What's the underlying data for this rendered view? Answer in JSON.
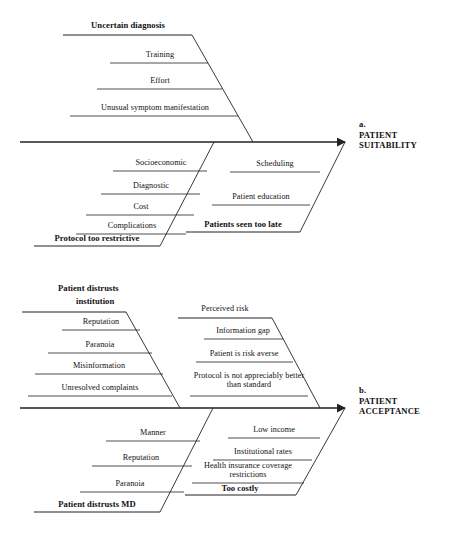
{
  "figure": {
    "type": "fishbone-ishikawa-diagram",
    "background_color": "#ffffff",
    "line_color": "#222222"
  },
  "diagrams": [
    {
      "id": "a",
      "marker": "a.",
      "effect_line1": "PATIENT",
      "effect_line2": "SUITABILITY",
      "categories": [
        {
          "name": "uncertain-diagnosis",
          "label": "Uncertain diagnosis",
          "position": "top-left",
          "causes": [
            "Training",
            "Effort",
            "Unusual symptom manifestation"
          ]
        },
        {
          "name": "protocol-too-restrictive",
          "label": "Protocol too restrictive",
          "position": "bottom-left",
          "causes": [
            "Socioeconomic",
            "Diagnostic",
            "Cost",
            "Complications"
          ]
        },
        {
          "name": "patients-seen-too-late",
          "label": "Patients seen too late",
          "position": "bottom-right",
          "causes": [
            "Scheduling",
            "Patient education"
          ]
        }
      ]
    },
    {
      "id": "b",
      "marker": "b.",
      "effect_line1": "PATIENT",
      "effect_line2": "ACCEPTANCE",
      "categories": [
        {
          "name": "patient-distrusts-institution",
          "label_line1": "Patient distrusts",
          "label_line2": "institution",
          "position": "top-left",
          "causes": [
            "Reputation",
            "Paranoia",
            "Misinformation",
            "Unresolved complaints"
          ]
        },
        {
          "name": "perceived-risk",
          "label": "Perceived risk",
          "position": "top-right",
          "causes": [
            "Information gap",
            "Patient is risk averse",
            "Protocol is not appreciably better than standard"
          ]
        },
        {
          "name": "patient-distrusts-md",
          "label": "Patient distrusts MD",
          "position": "bottom-left",
          "causes": [
            "Manner",
            "Reputation",
            "Paranoia"
          ]
        },
        {
          "name": "too-costly",
          "label": "Too costly",
          "position": "bottom-right",
          "causes": [
            "Low income",
            "Institutional rates",
            "Health insurance coverage restrictions"
          ]
        }
      ]
    }
  ],
  "labels": {
    "a_uncertain_diagnosis": "Uncertain diagnosis",
    "a_training": "Training",
    "a_effort": "Effort",
    "a_unusual_symptom": "Unusual symptom manifestation",
    "a_socioeconomic": "Socioeconomic",
    "a_diagnostic": "Diagnostic",
    "a_cost": "Cost",
    "a_complications": "Complications",
    "a_protocol_too_restrictive": "Protocol too restrictive",
    "a_scheduling": "Scheduling",
    "a_patient_education": "Patient education",
    "a_patients_seen_too_late": "Patients seen too late",
    "a_marker": "a.",
    "a_effect_1": "PATIENT",
    "a_effect_2": "SUITABILITY",
    "b_distrust_inst_1": "Patient distrusts",
    "b_distrust_inst_2": "institution",
    "b_reputation_top": "Reputation",
    "b_paranoia_top": "Paranoia",
    "b_misinformation": "Misinformation",
    "b_unresolved_complaints": "Unresolved complaints",
    "b_perceived_risk": "Perceived risk",
    "b_information_gap": "Information gap",
    "b_patient_risk_averse": "Patient is risk averse",
    "b_protocol_not_better": "Protocol is not appreciably better than standard",
    "b_manner": "Manner",
    "b_reputation_bot": "Reputation",
    "b_paranoia_bot": "Paranoia",
    "b_patient_distrusts_md": "Patient distrusts MD",
    "b_low_income": "Low income",
    "b_institutional_rates": "Institutional rates",
    "b_health_insurance": "Health insurance coverage restrictions",
    "b_too_costly": "Too costly",
    "b_marker": "b.",
    "b_effect_1": "PATIENT",
    "b_effect_2": "ACCEPTANCE"
  }
}
